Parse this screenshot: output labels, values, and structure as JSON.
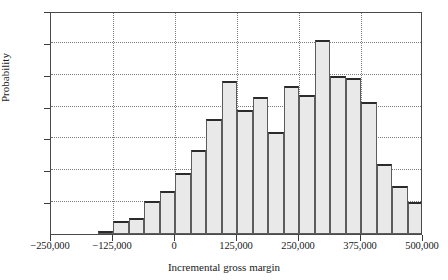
{
  "chart_data": {
    "type": "bar",
    "title": "",
    "xlabel": "Incremental gross margin",
    "ylabel": "Probability",
    "grid": true,
    "legend": null,
    "xlim": [
      -250000,
      500000
    ],
    "ylim": [
      0,
      0.14
    ],
    "xticks": [
      -250000,
      -125000,
      0,
      125000,
      250000,
      375000,
      500000
    ],
    "xtick_labels": [
      "−250,000",
      "−125,000",
      "0",
      "125,000",
      "250,000",
      "375,000",
      "500,000"
    ],
    "yticks": [
      0.0,
      0.02,
      0.04,
      0.06,
      0.08,
      0.1,
      0.12,
      0.14
    ],
    "ytick_labels": [
      "0.22",
      "0.02",
      "0.04",
      "0.06",
      "0.08",
      "0.10",
      "0.12",
      "0.14"
    ],
    "bin_width": 31250,
    "bins": [
      {
        "x_left": -156250,
        "x_right": -125000,
        "center": -140625,
        "value": 0.002
      },
      {
        "x_left": -125000,
        "x_right": -93750,
        "center": -109375,
        "value": 0.008
      },
      {
        "x_left": -93750,
        "x_right": -62500,
        "center": -78125,
        "value": 0.01
      },
      {
        "x_left": -62500,
        "x_right": -31250,
        "center": -46875,
        "value": 0.021
      },
      {
        "x_left": -31250,
        "x_right": 0,
        "center": -15625,
        "value": 0.027
      },
      {
        "x_left": 0,
        "x_right": 31250,
        "center": 15625,
        "value": 0.038
      },
      {
        "x_left": 31250,
        "x_right": 62500,
        "center": 46875,
        "value": 0.053
      },
      {
        "x_left": 62500,
        "x_right": 93750,
        "center": 78125,
        "value": 0.072
      },
      {
        "x_left": 93750,
        "x_right": 125000,
        "center": 109375,
        "value": 0.096
      },
      {
        "x_left": 125000,
        "x_right": 156250,
        "center": 140625,
        "value": 0.078
      },
      {
        "x_left": 156250,
        "x_right": 187500,
        "center": 171875,
        "value": 0.086
      },
      {
        "x_left": 187500,
        "x_right": 218750,
        "center": 203125,
        "value": 0.064
      },
      {
        "x_left": 218750,
        "x_right": 250000,
        "center": 234375,
        "value": 0.093
      },
      {
        "x_left": 250000,
        "x_right": 281250,
        "center": 265625,
        "value": 0.087
      },
      {
        "x_left": 281250,
        "x_right": 312500,
        "center": 296875,
        "value": 0.122
      },
      {
        "x_left": 312500,
        "x_right": 343750,
        "center": 328125,
        "value": 0.099
      },
      {
        "x_left": 343750,
        "x_right": 375000,
        "center": 359375,
        "value": 0.098
      },
      {
        "x_left": 375000,
        "x_right": 406250,
        "center": 390625,
        "value": 0.083
      },
      {
        "x_left": 406250,
        "x_right": 437500,
        "center": 421875,
        "value": 0.044
      },
      {
        "x_left": 437500,
        "x_right": 468750,
        "center": 453125,
        "value": 0.03
      },
      {
        "x_left": 468750,
        "x_right": 500000,
        "center": 484375,
        "value": 0.02
      }
    ],
    "colors": {
      "bar_fill": "#e9e9e9",
      "bar_edge": "#5c5c5c",
      "bar_top": "#2b2b2b",
      "grid": "#7d7d7d",
      "axis": "#4a4a4a",
      "text": "#1a1a1a"
    }
  }
}
